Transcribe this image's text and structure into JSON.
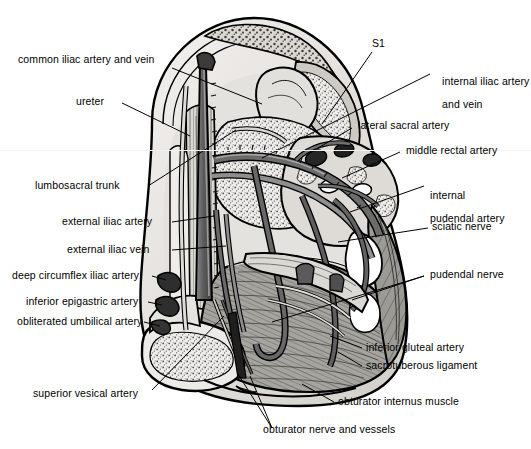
{
  "figure": {
    "background_color": "#ffffff",
    "ink_color": "#000000",
    "style": "black and white line drawing with halftone stippling and gray washes"
  },
  "labels": {
    "common_iliac": "common iliac artery and vein",
    "ureter": "ureter",
    "lumbosacral_trunk": "lumbosacral trunk",
    "external_iliac_artery": "external iliac artery",
    "external_iliac_vein": "external iliac vein",
    "deep_circumflex_iliac": "deep circumflex iliac artery",
    "inferior_epigastric": "inferior epigastric artery",
    "obliterated_umbilical": "obliterated umbilical artery",
    "superior_vesical": "superior vesical artery",
    "s1": "S1",
    "internal_iliac_line1": "internal iliac artery",
    "internal_iliac_line2": "and vein",
    "lateral_sacral": "lateral sacral artery",
    "middle_rectal": "middle rectal artery",
    "internal_pudendal_line1": "internal",
    "internal_pudendal_line2": "pudendal artery",
    "sciatic_nerve": "sciatic nerve",
    "pudendal_nerve": "pudendal nerve",
    "inferior_gluteal": "inferior gluteal artery",
    "sacrotuberous_ligament": "sacrotuberous ligament",
    "obturator_internus": "obturator internus muscle",
    "obturator_nerve_vessels": "obturator nerve and vessels"
  },
  "colors": {
    "bone_light": "#e8e6e2",
    "bone_mid": "#cfccc6",
    "muscle_gray": "#8d8d8d",
    "vessel_dark": "#595959",
    "vessel_mid": "#777777",
    "shadow": "#3a3a3a",
    "outline": "#000000"
  }
}
